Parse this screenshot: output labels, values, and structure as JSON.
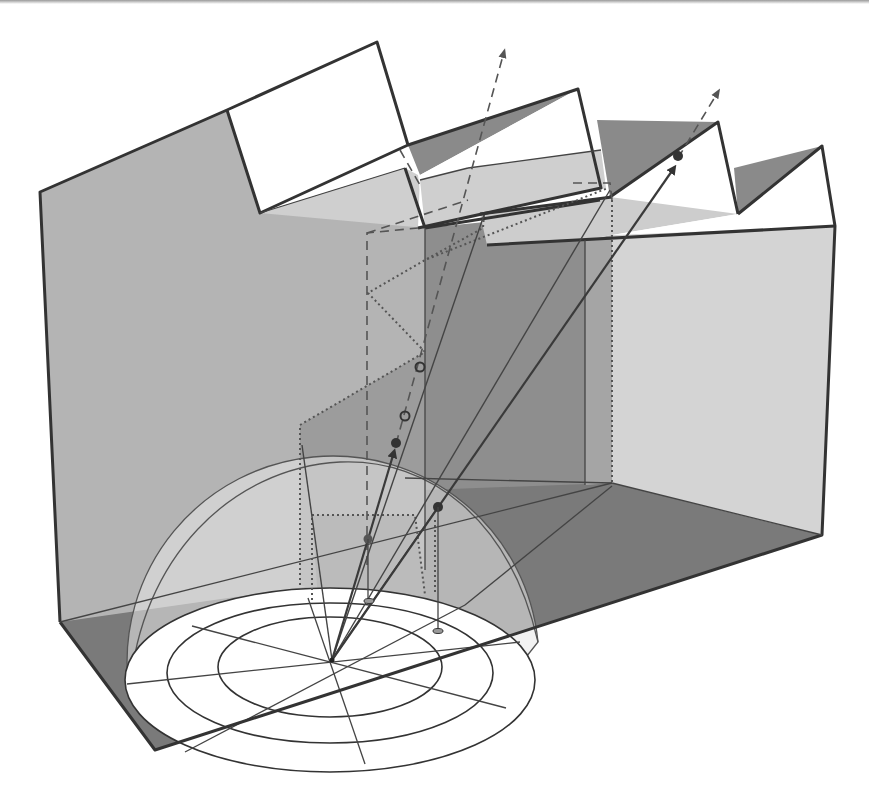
{
  "diagram": {
    "colors": {
      "background": "#ffffff",
      "left_wall": "#b4b4b4",
      "right_wall": "#d4d4d4",
      "floor": "#7a7a7a",
      "inner_wall": "#9a9a9a",
      "roof_glass": "#ffffff",
      "roof_slope_dark": "#8a8a8a",
      "roof_slope_light": "#cfcfcf",
      "hemisphere": "#e6e6e6",
      "grid_disk": "#ffffff",
      "edge": "#333333"
    },
    "elements": {
      "sky_hemisphere": {
        "rings": 3,
        "radial_lines": 8
      },
      "sawtooth_bays": 3,
      "rays": [
        {
          "type": "solid-arrow",
          "from": "origin",
          "to": "upper-right-roof"
        },
        {
          "type": "solid-arrow",
          "from": "origin",
          "to": "mid-marker"
        },
        {
          "type": "dashed-arrow",
          "direction": "sky-left"
        },
        {
          "type": "dashed-arrow",
          "direction": "sky-right"
        }
      ],
      "markers": {
        "filled_dots": 4,
        "open_circles": 2,
        "ground_projections": 2
      }
    }
  }
}
